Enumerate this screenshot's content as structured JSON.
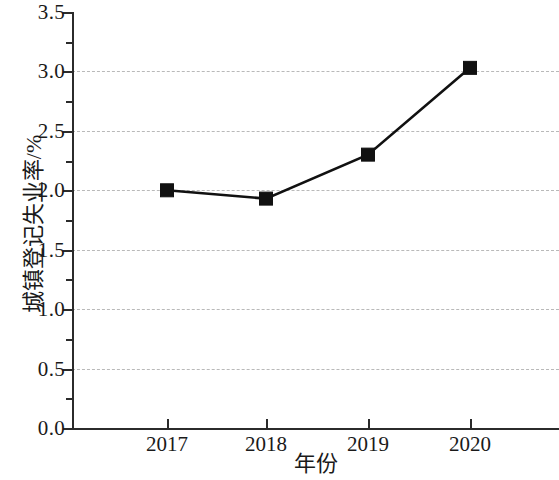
{
  "chart_data": {
    "type": "line",
    "title": "",
    "subtitle": "",
    "xlabel": "年份",
    "ylabel": "城镇登记失业率/%",
    "categories": [
      "2017",
      "2018",
      "2019",
      "2020"
    ],
    "values": [
      2.0,
      1.93,
      2.3,
      3.03
    ],
    "series": [
      {
        "name": "城镇登记失业率",
        "values": [
          2.0,
          1.93,
          2.3,
          3.03
        ]
      }
    ],
    "ylim": [
      0.0,
      3.5
    ],
    "y_ticks": [
      "0.0",
      "0.5",
      "1.0",
      "1.5",
      "2.0",
      "2.5",
      "3.0",
      "3.5"
    ],
    "y_tick_values": [
      0.0,
      0.5,
      1.0,
      1.5,
      2.0,
      2.5,
      3.0,
      3.5
    ],
    "y_minor_tick_values": [
      0.25,
      0.75,
      1.25,
      1.75,
      2.25,
      2.75,
      3.25
    ],
    "x_ticks": [
      "2017",
      "2018",
      "2019",
      "2020"
    ],
    "gridlines": {
      "horizontal": true,
      "vertical": false,
      "values": [
        0.5,
        1.0,
        1.5,
        2.0,
        2.5,
        3.0
      ],
      "style": "dashed",
      "color": "#b9b9b9"
    },
    "legend": {
      "visible": false,
      "position": "none",
      "entries": []
    },
    "marker": "filled-square",
    "line_color": "#111111",
    "marker_color": "#111111",
    "background_color": "#ffffff",
    "axis_color": "#2b2b2b"
  }
}
